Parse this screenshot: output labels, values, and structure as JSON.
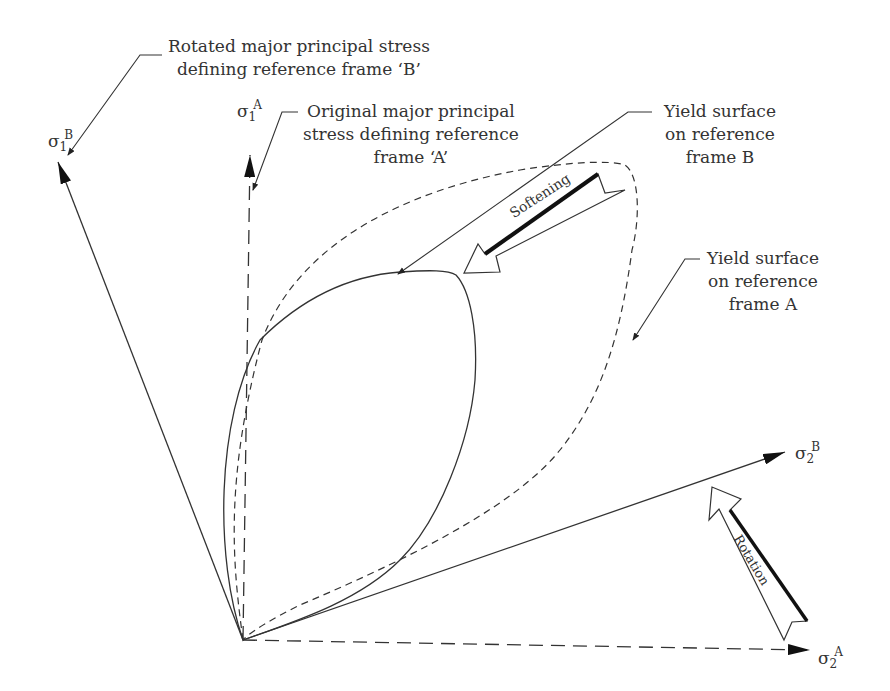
{
  "diagram": {
    "axes": {
      "sigma1_B": {
        "symbol": "σ",
        "sub": "1",
        "sup": "B",
        "style": "solid"
      },
      "sigma1_A": {
        "symbol": "σ",
        "sub": "1",
        "sup": "A",
        "style": "dashed"
      },
      "sigma2_B": {
        "symbol": "σ",
        "sub": "2",
        "sup": "B",
        "style": "solid"
      },
      "sigma2_A": {
        "symbol": "σ",
        "sub": "2",
        "sup": "A",
        "style": "dashed"
      }
    },
    "callouts": {
      "rotated_major": {
        "line1": "Rotated major principal stress",
        "line2": "defining reference frame ‘B’"
      },
      "original_major": {
        "line1": "Original major principal",
        "line2": "stress defining reference",
        "line3": "frame ‘A’"
      },
      "yield_B": {
        "line1": "Yield surface",
        "line2": "on reference",
        "line3": "frame B"
      },
      "yield_A": {
        "line1": "Yield surface",
        "line2": "on reference",
        "line3": "frame A"
      }
    },
    "arrows": {
      "softening": "Softening",
      "rotation": "Rotation"
    },
    "curves": {
      "yield_surface_A": {
        "style": "dashed"
      },
      "yield_surface_B": {
        "style": "solid"
      }
    }
  }
}
